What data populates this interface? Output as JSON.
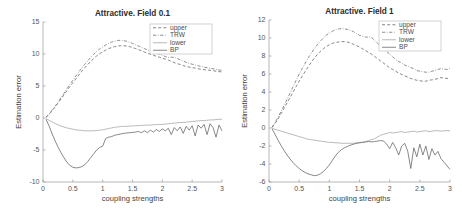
{
  "figure": {
    "panels": [
      {
        "id": "left",
        "title": "Attractive. Field 0.1",
        "xlabel": "coupling strengths",
        "ylabel": "Estimation error"
      },
      {
        "id": "right",
        "title": "Attractive. Field 1",
        "xlabel": "coupling strengths",
        "ylabel": "Estimation error"
      }
    ]
  },
  "legend": {
    "entries": [
      {
        "label": "upper",
        "style": "dashed",
        "color": "#6f6f6f"
      },
      {
        "label": "TRW",
        "style": "dashdot",
        "color": "#7a7a7a"
      },
      {
        "label": "lower",
        "style": "solid-thin",
        "color": "#9c9c9c"
      },
      {
        "label": "BP",
        "style": "solid",
        "color": "#6a6a6a"
      }
    ]
  },
  "chart_data": [
    {
      "type": "line",
      "title": "Attractive. Field 0.1",
      "xlabel": "coupling strengths",
      "ylabel": "Estimation error",
      "xlim": [
        0,
        3
      ],
      "ylim": [
        -10,
        15
      ],
      "xticks": [
        0,
        0.5,
        1,
        1.5,
        2,
        2.5,
        3
      ],
      "xticklabels": [
        "0",
        "0.5",
        "1",
        "1.5",
        "2",
        "2.5",
        "3"
      ],
      "yticks": [
        -10,
        -5,
        0,
        5,
        10,
        15
      ],
      "yticklabels": [
        "-10",
        "-5",
        "0",
        "5",
        "10",
        "15"
      ],
      "grid": false,
      "legend_position": "top-right",
      "x": [
        0.05,
        0.1,
        0.15,
        0.2,
        0.25,
        0.3,
        0.35,
        0.4,
        0.45,
        0.5,
        0.55,
        0.6,
        0.65,
        0.7,
        0.75,
        0.8,
        0.85,
        0.9,
        0.95,
        1.0,
        1.05,
        1.1,
        1.15,
        1.2,
        1.25,
        1.3,
        1.35,
        1.4,
        1.45,
        1.5,
        1.55,
        1.6,
        1.65,
        1.7,
        1.75,
        1.8,
        1.85,
        1.9,
        1.95,
        2.0,
        2.05,
        2.1,
        2.15,
        2.2,
        2.25,
        2.3,
        2.35,
        2.4,
        2.45,
        2.5,
        2.55,
        2.6,
        2.65,
        2.7,
        2.75,
        2.8,
        2.85,
        2.9,
        2.95,
        3.0
      ],
      "series": [
        {
          "name": "upper",
          "style": "dashed",
          "color": "#6f6f6f",
          "values": [
            0.1,
            0.55,
            1.1,
            1.7,
            2.3,
            2.95,
            3.6,
            4.25,
            4.9,
            5.5,
            6.1,
            6.7,
            7.3,
            7.85,
            8.35,
            8.85,
            9.3,
            9.7,
            10.05,
            10.35,
            10.6,
            10.85,
            11.0,
            11.15,
            11.25,
            11.3,
            11.3,
            11.25,
            11.15,
            11.0,
            10.85,
            10.7,
            10.5,
            10.3,
            10.1,
            9.95,
            9.8,
            9.65,
            9.5,
            9.35,
            9.2,
            9.05,
            8.85,
            8.65,
            8.5,
            8.35,
            8.2,
            8.05,
            7.95,
            7.85,
            7.8,
            7.7,
            7.6,
            7.55,
            7.5,
            7.45,
            7.4,
            7.3,
            7.25,
            7.2
          ]
        },
        {
          "name": "TRW",
          "style": "dashdot",
          "color": "#7a7a7a",
          "values": [
            0.12,
            0.6,
            1.2,
            1.8,
            2.45,
            3.15,
            3.85,
            4.55,
            5.25,
            5.9,
            6.55,
            7.2,
            7.8,
            8.4,
            8.95,
            9.45,
            9.95,
            10.4,
            10.8,
            11.1,
            11.4,
            11.65,
            11.85,
            12.0,
            12.1,
            12.15,
            12.1,
            12.0,
            11.85,
            11.65,
            11.45,
            11.25,
            11.05,
            10.85,
            10.65,
            10.5,
            10.35,
            10.2,
            10.0,
            9.8,
            9.6,
            9.45,
            9.5,
            9.5,
            9.3,
            9.1,
            8.9,
            8.7,
            8.55,
            8.4,
            8.3,
            8.15,
            8.05,
            7.95,
            7.85,
            7.75,
            7.7,
            7.6,
            7.5,
            7.45
          ]
        },
        {
          "name": "lower",
          "style": "solid-thin",
          "color": "#9c9c9c",
          "values": [
            -0.1,
            -0.35,
            -0.6,
            -0.85,
            -1.05,
            -1.25,
            -1.4,
            -1.55,
            -1.65,
            -1.75,
            -1.85,
            -1.9,
            -1.95,
            -2.0,
            -2.0,
            -2.0,
            -2.0,
            -1.95,
            -1.9,
            -1.85,
            -1.75,
            -1.65,
            -1.55,
            -1.45,
            -1.4,
            -1.35,
            -1.3,
            -1.3,
            -1.25,
            -1.25,
            -1.2,
            -1.2,
            -1.15,
            -1.15,
            -1.1,
            -1.1,
            -1.05,
            -1.05,
            -1.0,
            -1.0,
            -0.95,
            -0.9,
            -0.85,
            -0.8,
            -0.75,
            -0.7,
            -0.7,
            -0.65,
            -0.6,
            -0.55,
            -0.5,
            -0.45,
            -0.4,
            -0.4,
            -0.35,
            -0.3,
            -0.3,
            -0.25,
            -0.2,
            -0.2
          ]
        },
        {
          "name": "BP",
          "style": "solid",
          "color": "#6a6a6a",
          "values": [
            -0.2,
            -1.2,
            -2.4,
            -3.5,
            -4.5,
            -5.4,
            -6.2,
            -6.9,
            -7.4,
            -7.7,
            -7.8,
            -7.75,
            -7.6,
            -7.3,
            -6.8,
            -6.2,
            -5.6,
            -5.0,
            -4.6,
            -4.4,
            -3.2,
            -3.0,
            -2.9,
            -2.7,
            -2.6,
            -2.5,
            -2.4,
            -2.35,
            -2.3,
            -2.25,
            -2.2,
            -2.1,
            -2.3,
            -2.0,
            -2.3,
            -1.9,
            -2.2,
            -1.8,
            -2.1,
            -1.7,
            -2.0,
            -1.6,
            -2.6,
            -1.5,
            -2.0,
            -1.4,
            -2.4,
            -1.3,
            -1.9,
            -1.2,
            -2.8,
            -1.1,
            -1.6,
            -1.0,
            -2.6,
            -0.9,
            -1.5,
            -3.0,
            -1.1,
            -2.0
          ]
        }
      ]
    },
    {
      "type": "line",
      "title": "Attractive. Field 1",
      "xlabel": "coupling strengths",
      "ylabel": "Estimation error",
      "xlim": [
        0,
        3
      ],
      "ylim": [
        -6,
        12
      ],
      "xticks": [
        0,
        0.5,
        1,
        1.5,
        2,
        2.5,
        3
      ],
      "xticklabels": [
        "0",
        "0.5",
        "1",
        "1.5",
        "2",
        "2.5",
        "3"
      ],
      "yticks": [
        -6,
        -4,
        -2,
        0,
        2,
        4,
        6,
        8,
        10,
        12
      ],
      "yticklabels": [
        "-6",
        "-4",
        "-2",
        "0",
        "2",
        "4",
        "6",
        "8",
        "10",
        "12"
      ],
      "grid": false,
      "legend_position": "top-right",
      "x": [
        0.05,
        0.1,
        0.15,
        0.2,
        0.25,
        0.3,
        0.35,
        0.4,
        0.45,
        0.5,
        0.55,
        0.6,
        0.65,
        0.7,
        0.75,
        0.8,
        0.85,
        0.9,
        0.95,
        1.0,
        1.05,
        1.1,
        1.15,
        1.2,
        1.25,
        1.3,
        1.35,
        1.4,
        1.45,
        1.5,
        1.55,
        1.6,
        1.65,
        1.7,
        1.75,
        1.8,
        1.85,
        1.9,
        1.95,
        2.0,
        2.05,
        2.1,
        2.15,
        2.2,
        2.25,
        2.3,
        2.35,
        2.4,
        2.45,
        2.5,
        2.55,
        2.6,
        2.65,
        2.7,
        2.75,
        2.8,
        2.85,
        2.9,
        2.95,
        3.0
      ],
      "series": [
        {
          "name": "upper",
          "style": "dashed",
          "color": "#6f6f6f",
          "values": [
            0.05,
            0.5,
            1.0,
            1.6,
            2.2,
            2.8,
            3.4,
            4.0,
            4.6,
            5.2,
            5.75,
            6.3,
            6.8,
            7.3,
            7.75,
            8.15,
            8.5,
            8.8,
            9.05,
            9.25,
            9.4,
            9.5,
            9.55,
            9.6,
            9.6,
            9.55,
            9.45,
            9.3,
            9.15,
            9.0,
            8.8,
            8.6,
            8.4,
            8.2,
            7.95,
            7.7,
            7.45,
            7.2,
            6.95,
            6.7,
            6.5,
            6.3,
            6.1,
            5.95,
            5.8,
            5.65,
            5.5,
            5.4,
            5.3,
            5.25,
            5.2,
            5.2,
            5.3,
            5.35,
            5.4,
            5.5,
            5.6,
            5.55,
            5.5,
            5.6
          ]
        },
        {
          "name": "TRW",
          "style": "dashdot",
          "color": "#7a7a7a",
          "values": [
            0.08,
            0.6,
            1.2,
            1.85,
            2.5,
            3.2,
            3.9,
            4.6,
            5.3,
            6.0,
            6.6,
            7.2,
            7.8,
            8.3,
            8.8,
            9.25,
            9.65,
            10.0,
            10.3,
            10.55,
            10.75,
            10.9,
            11.0,
            11.05,
            11.0,
            10.95,
            10.85,
            10.7,
            10.5,
            10.3,
            10.2,
            10.1,
            10.1,
            10.1,
            9.7,
            9.4,
            9.1,
            8.8,
            8.5,
            8.2,
            7.9,
            7.6,
            7.4,
            7.2,
            7.0,
            6.85,
            6.7,
            6.6,
            6.4,
            6.3,
            6.25,
            6.2,
            6.2,
            6.3,
            6.4,
            6.5,
            6.6,
            6.55,
            6.5,
            6.6
          ]
        },
        {
          "name": "lower",
          "style": "solid-thin",
          "color": "#9c9c9c",
          "values": [
            -0.05,
            -0.15,
            -0.25,
            -0.35,
            -0.45,
            -0.55,
            -0.65,
            -0.75,
            -0.85,
            -0.95,
            -1.05,
            -1.15,
            -1.25,
            -1.3,
            -1.35,
            -1.4,
            -1.45,
            -1.5,
            -1.55,
            -1.6,
            -1.6,
            -1.65,
            -1.65,
            -1.7,
            -1.7,
            -1.7,
            -1.7,
            -1.7,
            -1.65,
            -1.6,
            -1.6,
            -1.5,
            -1.4,
            -1.3,
            -1.2,
            -1.0,
            -0.8,
            -0.7,
            -0.6,
            -0.5,
            -0.55,
            -0.5,
            -0.45,
            -0.4,
            -0.5,
            -0.45,
            -0.4,
            -0.35,
            -0.45,
            -0.4,
            -0.35,
            -0.3,
            -0.4,
            -0.35,
            -0.3,
            -0.3,
            -0.35,
            -0.3,
            -0.3,
            -0.3
          ]
        },
        {
          "name": "BP",
          "style": "solid",
          "color": "#6a6a6a",
          "values": [
            -0.1,
            -0.7,
            -1.35,
            -1.95,
            -2.5,
            -3.0,
            -3.45,
            -3.85,
            -4.2,
            -4.5,
            -4.75,
            -4.95,
            -5.1,
            -5.2,
            -5.3,
            -5.25,
            -5.1,
            -4.85,
            -4.5,
            -4.1,
            -3.6,
            -3.1,
            -2.7,
            -2.4,
            -2.2,
            -2.05,
            -1.9,
            -1.8,
            -1.7,
            -1.65,
            -1.6,
            -1.55,
            -1.5,
            -1.55,
            -1.5,
            -1.45,
            -1.4,
            -1.45,
            -1.8,
            -2.3,
            -1.6,
            -2.2,
            -3.0,
            -2.0,
            -1.7,
            -2.6,
            -4.5,
            -2.2,
            -3.2,
            -1.8,
            -3.0,
            -2.0,
            -3.5,
            -2.3,
            -3.0,
            -2.6,
            -3.4,
            -3.8,
            -4.2,
            -4.6
          ]
        }
      ]
    }
  ]
}
